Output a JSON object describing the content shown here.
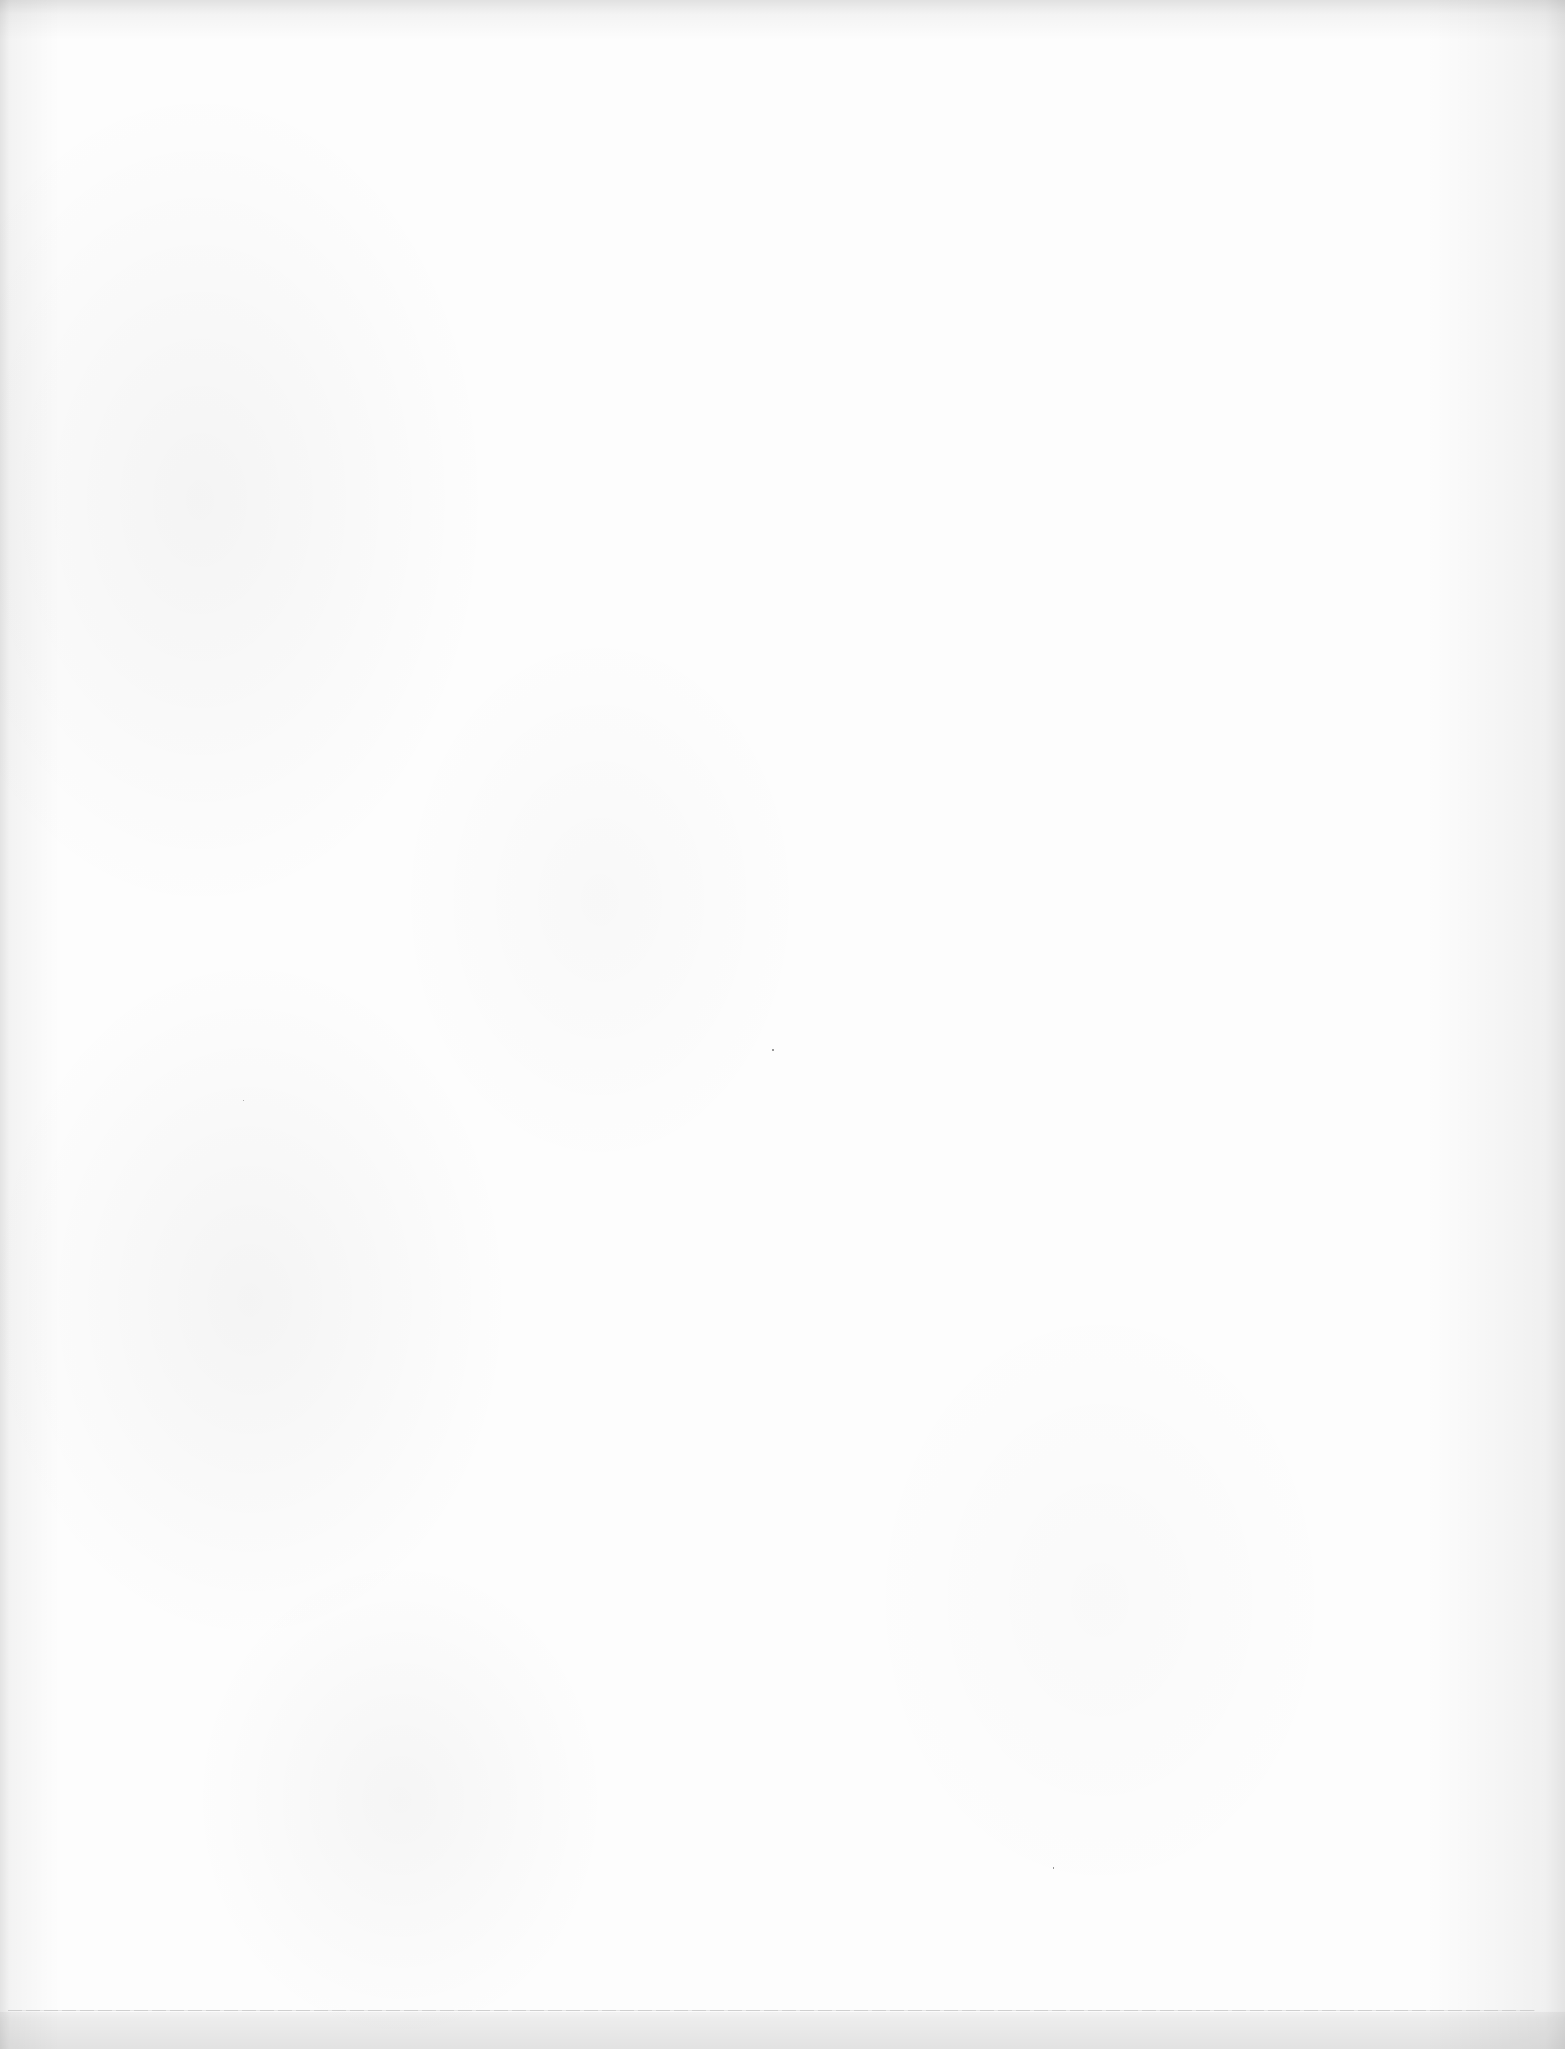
{
  "page": {
    "type": "blank-scanned-page",
    "background_color": "#fdfdfd",
    "edge_shadow_color": "#e0e0e0",
    "has_text": false,
    "bottom_rule": {
      "visible": true,
      "color": "#cfcfcf"
    },
    "specks": [
      {
        "x": 772,
        "y": 1049
      },
      {
        "x": 1053,
        "y": 1867
      },
      {
        "x": 243,
        "y": 1100
      }
    ]
  }
}
